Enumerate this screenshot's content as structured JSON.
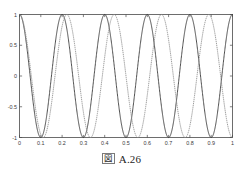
{
  "figure": {
    "caption_glyph": "図",
    "caption_glyph_name": "zu-kanji-figure-marker",
    "caption_text": "A.26"
  },
  "chart_data": {
    "type": "line",
    "title": "",
    "subtitle": "",
    "xlabel": "",
    "ylabel": "",
    "xlim": [
      0,
      1
    ],
    "ylim": [
      -1,
      1
    ],
    "grid": false,
    "legend": "none",
    "x_ticks": [
      0,
      0.1,
      0.2,
      0.3,
      0.4,
      0.5,
      0.6,
      0.7,
      0.8,
      0.9,
      1
    ],
    "x_tick_labels": [
      "0",
      "0.1",
      "0.2",
      "0.3",
      "0.4",
      "0.5",
      "0.6",
      "0.7",
      "0.8",
      "0.9",
      "1"
    ],
    "y_ticks": [
      -1,
      -0.5,
      0,
      0.5,
      1
    ],
    "y_tick_labels": [
      "-1",
      "-0.5",
      "0",
      "0.5",
      "1"
    ],
    "series": [
      {
        "name": "solid-cosine",
        "style": "solid",
        "color": "#3c3c3c",
        "form": "cosine",
        "amplitude": 1,
        "frequency_hz": 5,
        "phase_rad": 0,
        "peaks_x": [
          0,
          0.2,
          0.4,
          0.6,
          0.8,
          1.0
        ],
        "troughs_x": [
          0.1,
          0.3,
          0.5,
          0.7,
          0.9
        ]
      },
      {
        "name": "dotted-cosine",
        "style": "dotted",
        "color": "#8d8d8d",
        "form": "cosine",
        "amplitude": 1,
        "frequency_hz": 4.5,
        "phase_rad": 0,
        "peaks_x": [
          0,
          0.2222,
          0.4444,
          0.6667,
          0.8889
        ],
        "troughs_x": [
          0.1111,
          0.3333,
          0.5556,
          0.7778,
          1.0
        ]
      }
    ]
  }
}
